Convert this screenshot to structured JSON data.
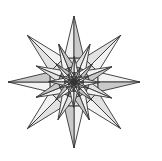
{
  "figure": {
    "kind": "geometric-figure",
    "background_color": "#ffffff",
    "stroke_color": "#333333",
    "stroke_width": 0.9,
    "fill_light": "#f2f2f2",
    "fill_mid": "#e2e2e2",
    "fill_dark": "#c9c9c9",
    "center_x": 74,
    "center_y": 82,
    "points": 8,
    "outer_radius": 66,
    "inner_radius": 26,
    "iterations": 7,
    "scale_step": 0.62,
    "rotation_step_deg": 23,
    "start_rotation_deg": -90,
    "tips": [
      {
        "name": "tip-top",
        "angle_deg": -90,
        "x": 74,
        "y": 16
      },
      {
        "name": "tip-upper-right",
        "angle_deg": -45,
        "x": 121,
        "y": 35
      },
      {
        "name": "tip-right",
        "angle_deg": 0,
        "x": 140,
        "y": 82
      },
      {
        "name": "tip-lower-right",
        "angle_deg": 45,
        "x": 121,
        "y": 129
      },
      {
        "name": "tip-bottom",
        "angle_deg": 90,
        "x": 74,
        "y": 148
      },
      {
        "name": "tip-lower-left",
        "angle_deg": 135,
        "x": 27,
        "y": 129
      },
      {
        "name": "tip-left",
        "angle_deg": 180,
        "x": 8,
        "y": 82
      },
      {
        "name": "tip-upper-left",
        "angle_deg": 225,
        "x": 27,
        "y": 35
      }
    ]
  }
}
